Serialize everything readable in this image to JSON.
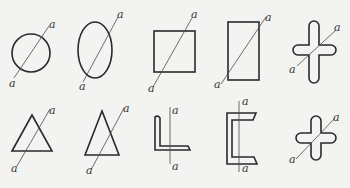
{
  "diagram": {
    "axis_label": "a",
    "shapes": [
      {
        "id": "circle",
        "row": 1,
        "col": 1,
        "top_label": "a",
        "bottom_label": "a"
      },
      {
        "id": "ellipse",
        "row": 1,
        "col": 2,
        "top_label": "a",
        "bottom_label": "a"
      },
      {
        "id": "square",
        "row": 1,
        "col": 3,
        "top_label": "a",
        "bottom_label": "a"
      },
      {
        "id": "rectangle",
        "row": 1,
        "col": 4,
        "top_label": "a",
        "bottom_label": "a"
      },
      {
        "id": "cross",
        "row": 1,
        "col": 5,
        "top_label": "a",
        "bottom_label": "a"
      },
      {
        "id": "equilateral-triangle",
        "row": 2,
        "col": 1,
        "top_label": "a",
        "bottom_label": "a"
      },
      {
        "id": "isosceles-triangle",
        "row": 2,
        "col": 2,
        "top_label": "a",
        "bottom_label": "a"
      },
      {
        "id": "angle-section",
        "row": 2,
        "col": 3,
        "top_label": "a",
        "bottom_label": "a"
      },
      {
        "id": "channel-section",
        "row": 2,
        "col": 4,
        "top_label": "a",
        "bottom_label": "a"
      },
      {
        "id": "plus-section",
        "row": 2,
        "col": 5,
        "top_label": "a",
        "bottom_label": "a"
      }
    ]
  }
}
